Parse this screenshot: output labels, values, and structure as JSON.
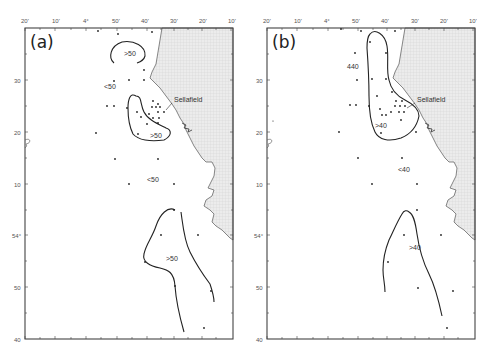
{
  "figure": {
    "panels": [
      {
        "id": "a",
        "letter": "(a)",
        "site_label": "Sellafield",
        "top_axis_labels": [
          "20'",
          "10'",
          "4°",
          "50'",
          "40'",
          "30'",
          "20'",
          "10'"
        ],
        "left_axis_labels": [
          "30",
          "20",
          "10",
          "54°",
          "50",
          "40"
        ],
        "contour_labels": [
          ">50",
          "<50",
          ">50",
          "<50",
          ">50"
        ]
      },
      {
        "id": "b",
        "letter": "(b)",
        "site_label": "Sellafield",
        "top_axis_labels": [
          "20'",
          "10'",
          "4°",
          "50'",
          "40'",
          "30'",
          "20'",
          "10'"
        ],
        "left_axis_labels": [
          "30",
          "20",
          "10",
          "54°",
          "50",
          "40"
        ],
        "contour_labels": [
          "440",
          ">40",
          "<40",
          ">40"
        ]
      }
    ]
  },
  "colors": {
    "background": "#ffffff",
    "frame": "#444444",
    "land_fill": "#e4e4e4",
    "land_grid": "#cfcfcf",
    "contour": "#222222",
    "point": "#222222",
    "text": "#333333"
  }
}
